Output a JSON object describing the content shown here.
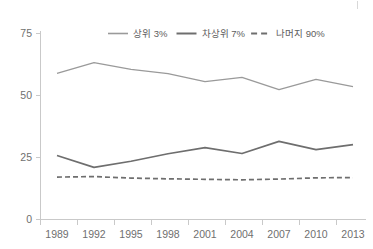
{
  "chart_data": {
    "type": "line",
    "title": "",
    "subtitle": "",
    "xlabel": "",
    "ylabel": "",
    "xlim": [
      1989,
      2013
    ],
    "ylim": [
      0,
      75
    ],
    "ytick_labels": [
      "0",
      "25",
      "50",
      "75"
    ],
    "yticks": [
      0,
      25,
      50,
      75
    ],
    "xtick_labels": [
      "1989",
      "1992",
      "1995",
      "1998",
      "2001",
      "2004",
      "2007",
      "2010",
      "2013"
    ],
    "xticks": [
      1989,
      1992,
      1995,
      1998,
      2001,
      2004,
      2007,
      2010,
      2013
    ],
    "grid": false,
    "legend_position": "top-center",
    "x": [
      1989,
      1992,
      1995,
      1998,
      2001,
      2004,
      2007,
      2010,
      2013
    ],
    "series": [
      {
        "name": "상위 3%",
        "values": [
          58.9,
          63.3,
          60.5,
          58.8,
          55.6,
          57.3,
          52.4,
          56.5,
          53.6
        ],
        "color": "#9a9a9a",
        "style": "solid",
        "width": 1.3
      },
      {
        "name": "차상위 7%",
        "values": [
          25.8,
          21.0,
          23.5,
          26.5,
          29.0,
          26.6,
          31.5,
          28.2,
          30.2
        ],
        "color": "#6e6e6e",
        "style": "solid",
        "width": 1.7
      },
      {
        "name": "나머지 90%",
        "values": [
          17.1,
          17.3,
          16.7,
          16.4,
          16.2,
          16.0,
          16.3,
          16.8,
          16.9
        ],
        "color": "#6e6e6e",
        "style": "dashed",
        "width": 1.7
      }
    ]
  },
  "legend": {
    "items": [
      {
        "label": "상위 3%"
      },
      {
        "label": "차상위 7%"
      },
      {
        "label": "나머지 90%"
      }
    ]
  },
  "axis": {
    "y_labels": [
      "75",
      "50",
      "25",
      "0"
    ],
    "x_labels": [
      "1989",
      "1992",
      "1995",
      "1998",
      "2001",
      "2004",
      "2007",
      "2010",
      "2013"
    ]
  }
}
